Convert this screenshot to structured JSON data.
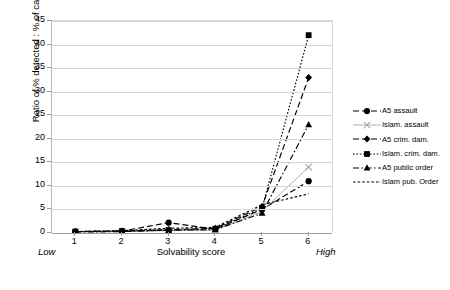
{
  "chart_data": {
    "type": "line",
    "title": "",
    "xlabel": "Solvability score",
    "ylabel": "Ratio of % detected : % of cases",
    "categories": [
      "1",
      "2",
      "3",
      "4",
      "5",
      "6"
    ],
    "x_axis_low_label": "Low",
    "x_axis_high_label": "High",
    "ylim": [
      0,
      45
    ],
    "ytick_labels": [
      "0",
      "5",
      "10",
      "15",
      "20",
      "25",
      "30",
      "35",
      "40",
      "45"
    ],
    "ytick_values": [
      0,
      5,
      10,
      15,
      20,
      25,
      30,
      35,
      40,
      45
    ],
    "grid": "horizontal",
    "legend_position": "right",
    "series": [
      {
        "name": "A5 assault",
        "marker": "circle",
        "dash": "dashed",
        "color": "#000000",
        "values": [
          0.3,
          0.4,
          2.2,
          0.8,
          5.0,
          11.0
        ]
      },
      {
        "name": "Islam. assault",
        "marker": "cross",
        "dash": "solid",
        "color": "#a6a6a6",
        "values": [
          0.2,
          0.3,
          0.5,
          0.6,
          4.6,
          14.0
        ]
      },
      {
        "name": "A5 crim. dam.",
        "marker": "diamond",
        "dash": "dashed",
        "color": "#000000",
        "values": [
          0.3,
          0.4,
          0.7,
          1.0,
          5.6,
          33.0
        ]
      },
      {
        "name": "Islam. crim. dam.",
        "marker": "square",
        "dash": "dotted",
        "color": "#000000",
        "values": [
          0.3,
          0.4,
          0.6,
          0.9,
          5.2,
          42.0
        ]
      },
      {
        "name": "A5 public order",
        "marker": "triangle",
        "dash": "dashdot",
        "color": "#000000",
        "values": [
          0.2,
          0.3,
          0.6,
          0.7,
          4.2,
          23.0
        ]
      },
      {
        "name": "Islam pub. Order",
        "marker": "none",
        "dash": "fine-dashed",
        "color": "#000000",
        "values": [
          0.3,
          0.5,
          1.0,
          1.2,
          6.0,
          8.3
        ]
      }
    ]
  }
}
